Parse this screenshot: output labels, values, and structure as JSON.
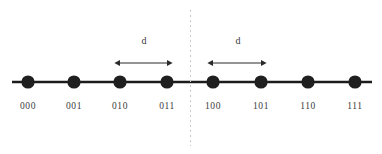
{
  "figure": {
    "type": "number-line-diagram",
    "background_color": "#ffffff",
    "line_color": "#1c1c1c",
    "node_color": "#1f1f1f",
    "label_color": "#3a3a3a",
    "divider_color": "#c9c9c9",
    "arrow_color": "#2b2b2b"
  },
  "axis": {
    "x_start": 12,
    "x_end": 372,
    "y": 82,
    "stroke_width": 2.6
  },
  "divider": {
    "x": 190.5,
    "y_start": 10,
    "y_end": 146,
    "dash": "2 3",
    "stroke_width": 1
  },
  "nodes": [
    {
      "label": "000",
      "x": 28,
      "r": 6.6
    },
    {
      "label": "001",
      "x": 74,
      "r": 6.6
    },
    {
      "label": "010",
      "x": 120,
      "r": 6.6
    },
    {
      "label": "011",
      "x": 167,
      "r": 6.6
    },
    {
      "label": "100",
      "x": 213,
      "r": 6.6
    },
    {
      "label": "101",
      "x": 261,
      "r": 6.6
    },
    {
      "label": "110",
      "x": 308,
      "r": 6.6
    },
    {
      "label": "111",
      "x": 355,
      "r": 6.6
    }
  ],
  "node_label_y": 102,
  "measures": [
    {
      "label": "d",
      "x1": 120,
      "x2": 167,
      "y": 63,
      "label_x": 144,
      "label_y": 36
    },
    {
      "label": "d",
      "x1": 213,
      "x2": 261,
      "y": 63,
      "label_x": 238,
      "label_y": 36
    }
  ],
  "chart_data": {
    "type": "scatter",
    "title": "",
    "xlabel": "",
    "ylabel": "",
    "categories": [
      "000",
      "001",
      "010",
      "011",
      "100",
      "101",
      "110",
      "111"
    ],
    "x": [
      0,
      1,
      2,
      3,
      4,
      5,
      6,
      7
    ],
    "values": [
      0,
      0,
      0,
      0,
      0,
      0,
      0,
      0
    ],
    "annotations": [
      {
        "text": "d",
        "between": [
          "010",
          "011"
        ]
      },
      {
        "text": "d",
        "between": [
          "100",
          "101"
        ]
      },
      {
        "text": "divider",
        "between": [
          "011",
          "100"
        ]
      }
    ],
    "grid": false,
    "legend": "none"
  }
}
